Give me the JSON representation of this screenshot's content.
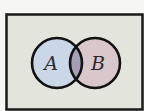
{
  "diagram": {
    "type": "venn",
    "universe": {
      "label": "",
      "fill": "#e3e5dd",
      "border": "#1a1a1a"
    },
    "sets": [
      {
        "label": "A",
        "fill": "#c9d7e7"
      },
      {
        "label": "B",
        "fill": "#d9c7cc"
      }
    ],
    "intersection": {
      "fill": "#a79fb5"
    }
  }
}
